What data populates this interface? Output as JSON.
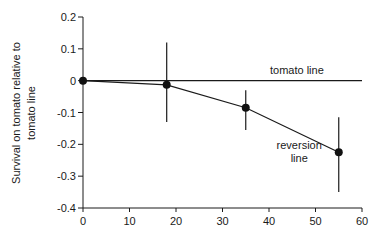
{
  "chart_data": {
    "type": "line",
    "title": "",
    "xlabel": "",
    "ylabel": [
      "Survival on tomato relative to",
      "tomato line"
    ],
    "xlim": [
      0,
      60
    ],
    "ylim": [
      -0.4,
      0.2
    ],
    "x_ticks": [
      0,
      10,
      20,
      30,
      40,
      50,
      60
    ],
    "y_ticks": [
      0.2,
      0.1,
      0,
      -0.1,
      -0.2,
      -0.3,
      -0.4
    ],
    "y_tick_labels": [
      "0.2",
      "0.1",
      "0",
      "-0.1",
      "-0.2",
      "-0.3",
      "-0.4"
    ],
    "grid": false,
    "series": [
      {
        "name": "tomato line",
        "x": [
          0,
          60
        ],
        "values": [
          0,
          0
        ],
        "markers": false
      },
      {
        "name": "reversion line",
        "x": [
          0,
          18,
          35,
          55
        ],
        "values": [
          0,
          -0.013,
          -0.085,
          -0.225
        ],
        "error_low": [
          0,
          -0.13,
          -0.155,
          -0.35
        ],
        "error_high": [
          0,
          0.12,
          -0.03,
          -0.115
        ],
        "markers": true
      }
    ],
    "annotations": [
      {
        "text": "tomato line",
        "x": 46,
        "y": 0.02
      },
      {
        "text": [
          "reversion",
          "line"
        ],
        "x": 46.5,
        "y": -0.215
      }
    ]
  }
}
